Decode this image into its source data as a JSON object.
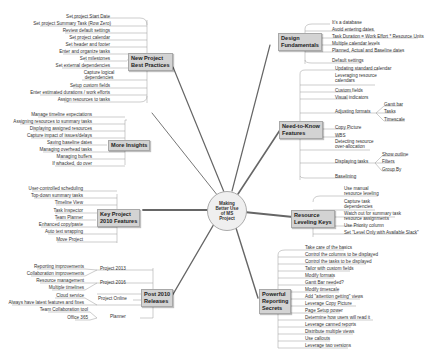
{
  "center": {
    "line1": "Making",
    "line2": "Better Use",
    "line3": "of MS",
    "line4": "Project"
  },
  "branches": {
    "new_project": {
      "title1": "New Project",
      "title2": "Best Practices",
      "items": [
        "Set project Start Date",
        "Set project Summary Task (Row Zero)",
        "Review default settings",
        "Set project calendar",
        "Set header and footer",
        "Enter and organize tasks",
        "Set milestones",
        "Set external dependencies",
        "Capture logical dependencies",
        "Setup custom fields",
        "Enter estimated durations / work efforts",
        "Assign resources to tasks"
      ]
    },
    "more_insights": {
      "title1": "More Insights",
      "items": [
        "Manage timeline expectations",
        "Assigning resources to summary tasks",
        "Displaying assigned resources",
        "Capture impact of issues/delays",
        "Saving baseline dates",
        "Managing overhead tasks",
        "Managing buffers",
        "If whacked, do over"
      ]
    },
    "key_2010": {
      "title1": "Key Project",
      "title2": "2010 Features",
      "items": [
        "User-controlled scheduling",
        "Top-down summary tasks",
        "Timeline View",
        "Task Inspector",
        "Team Planner",
        "Enhanced copy/paste",
        "Auto text wrapping",
        "Move Project"
      ]
    },
    "post_2010": {
      "title1": "Post 2010",
      "title2": "Releases",
      "groups": [
        {
          "label": "Project 2013",
          "items": [
            "Reporting improvements",
            "Collaboration improvements"
          ]
        },
        {
          "label": "Project 2016",
          "items": [
            "Resource management",
            "Multiple timelines"
          ]
        },
        {
          "label": "Project Online",
          "items": [
            "Cloud service",
            "Always have latest features and fixes"
          ]
        },
        {
          "label": "Planner",
          "items": [
            "Team Collaboration tool",
            "Office 365"
          ]
        }
      ]
    },
    "design": {
      "title1": "Design",
      "title2": "Fundamentals",
      "items": [
        "It's a database",
        "Avoid entering dates",
        "Task Duration = Work Effort * Resource Units",
        "Multiple calendar levels",
        "Planned, Actual and Baseline dates",
        "Default settings"
      ]
    },
    "need_to_know": {
      "title1": "Need-to-Know",
      "title2": "Features",
      "items": [
        "Updating standard calendar",
        "Leveraging resource calendars",
        "Custom fields",
        "Visual indicators",
        "Adjusting formats",
        "Copy Picture",
        "WBS",
        "Detecting resource over-allocation",
        "Displaying tasks",
        "Baselining"
      ],
      "formats_sub": [
        "Gantt bar",
        "Tasks",
        "Timescale"
      ],
      "displaying_sub": [
        "Show outline",
        "Filters",
        "Group By"
      ]
    },
    "resource_leveling": {
      "title1": "Resource",
      "title2": "Leveling Keys",
      "items": [
        "Use manual resource leveling",
        "Capture task dependencies",
        "Watch out for summary task resource assignments",
        "Use Priority column",
        "Set \"Level Only with Available Slack\""
      ]
    },
    "reporting": {
      "title1": "Powerful",
      "title2": "Reporting",
      "title3": "Secrets",
      "items": [
        "Take care of the basics",
        "Control the columns to be displayed",
        "Control the tasks to be displayed",
        "Tailor with custom fields",
        "Modify formats",
        "Gantt Bar needed?",
        "Modify timescale",
        "Add \"attention getting\" views",
        "Leverage Copy Picture",
        "Page Setup power",
        "Determine how users will read it",
        "Leverage canned reports",
        "Distribute multiple views",
        "Use callouts",
        "Leverage two versions"
      ]
    }
  },
  "colors": {
    "node_fill": "#d3d3d3",
    "node_border": "#a8a8a8",
    "line": "#555555",
    "leaf_line": "#9a9a9a",
    "text": "#333333"
  }
}
